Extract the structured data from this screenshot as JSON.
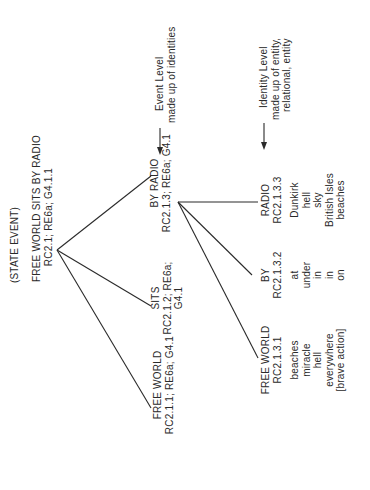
{
  "diagram": {
    "header": "(STATE EVENT)",
    "root": {
      "label": "FREE WORLD SITS BY RADIO",
      "code": "RC2.1; RE6a; G4.1.1"
    },
    "event_level": [
      {
        "label": "FREE WORLD",
        "code": "RC2.1.1; RE6a; G4.1"
      },
      {
        "label": "SITS",
        "code_line1": "RC2.1.2; RE6a;",
        "code_line2": "G4.1"
      },
      {
        "label": "BY RADIO",
        "code": "RC2.1.3; RE6a; G4.1"
      }
    ],
    "identity_level": [
      {
        "label": "FREE WORLD",
        "code": "RC2.1.3.1",
        "words": [
          "beaches",
          "miracle",
          "hell",
          "everywhere",
          "[brave action]"
        ]
      },
      {
        "label": "BY",
        "code": "RC2.1.3.2",
        "words": [
          "at",
          "under",
          "in",
          "in",
          "on"
        ]
      },
      {
        "label": "RADIO",
        "code": "RC2.1.3.3",
        "words": [
          "Dunkirk",
          "hell",
          "sky",
          "British Isles",
          "beaches"
        ]
      }
    ],
    "annotations": {
      "event_level": {
        "line1": "Event Level",
        "line2": "made up of identities"
      },
      "identity_level": {
        "line1": "Identity Level",
        "line2": "made up of entity,",
        "line3": "relational, entity"
      }
    },
    "colors": {
      "ink": "#2a2a2a",
      "background": "#ffffff"
    }
  }
}
